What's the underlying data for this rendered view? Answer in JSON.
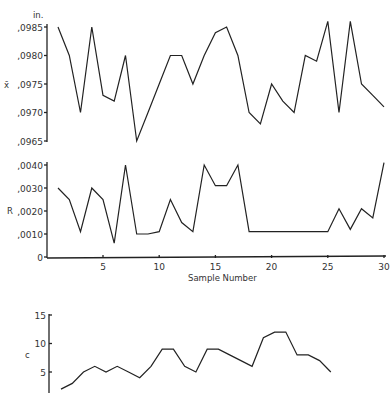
{
  "chart_data": [
    {
      "type": "line",
      "title": "X-bar chart",
      "ylabel": "x̄",
      "unit_label": "in.",
      "xlabel": "",
      "x": [
        1,
        2,
        3,
        4,
        5,
        6,
        7,
        8,
        9,
        10,
        11,
        12,
        13,
        14,
        15,
        16,
        17,
        18,
        19,
        20,
        21,
        22,
        23,
        24,
        25,
        26,
        27,
        28,
        29,
        30
      ],
      "values": [
        0.0985,
        0.098,
        0.097,
        0.0985,
        0.0973,
        0.0972,
        0.098,
        0.0965,
        0.097,
        0.0975,
        0.098,
        0.098,
        0.0975,
        0.098,
        0.0984,
        0.0985,
        0.098,
        0.097,
        0.0968,
        0.0975,
        0.0972,
        0.097,
        0.098,
        0.0979,
        0.0986,
        0.097,
        0.0986,
        0.0975,
        0.0973,
        0.0971
      ],
      "yticks": [
        ".0965",
        ".0970",
        ".0975",
        ".0980",
        ".0985"
      ],
      "ylim": [
        0.0965,
        0.0985
      ],
      "grid": false
    },
    {
      "type": "line",
      "title": "R chart",
      "ylabel": "R",
      "xlabel": "Sample Number",
      "x": [
        1,
        2,
        3,
        4,
        5,
        6,
        7,
        8,
        9,
        10,
        11,
        12,
        13,
        14,
        15,
        16,
        17,
        18,
        19,
        20,
        21,
        22,
        23,
        24,
        25,
        26,
        27,
        28,
        29,
        30
      ],
      "values": [
        0.003,
        0.0025,
        0.0011,
        0.003,
        0.0025,
        0.0006,
        0.004,
        0.001,
        0.001,
        0.0011,
        0.0025,
        0.0015,
        0.0011,
        0.004,
        0.0031,
        0.0031,
        0.004,
        0.0011,
        0.0011,
        0.0011,
        0.0011,
        0.0011,
        0.0011,
        0.0011,
        0.0011,
        0.0021,
        0.0012,
        0.0021,
        0.0017,
        0.0041
      ],
      "yticks": [
        "0",
        ".0010",
        ".0020",
        ".0030",
        ".0040"
      ],
      "xticks": [
        "5",
        "10",
        "15",
        "20",
        "25",
        "30"
      ],
      "ylim": [
        0,
        0.004
      ],
      "xlim": [
        0,
        30
      ],
      "grid": false
    },
    {
      "type": "line",
      "title": "c chart",
      "ylabel": "c",
      "xlabel": "",
      "x": [
        1,
        2,
        3,
        4,
        5,
        6,
        7,
        8,
        9,
        10,
        11,
        12,
        13,
        14,
        15,
        16,
        17,
        18,
        19,
        20,
        21,
        22,
        23,
        24,
        25
      ],
      "values": [
        2,
        3,
        5,
        6,
        5,
        6,
        5,
        4,
        6,
        9,
        9,
        6,
        5,
        9,
        9,
        8,
        7,
        6,
        11,
        12,
        12,
        8,
        8,
        7,
        5
      ],
      "yticks": [
        "5",
        "10",
        "15"
      ],
      "ylim": [
        0,
        15
      ],
      "grid": false
    }
  ],
  "labels": {
    "xbar_unit": "in.",
    "xbar_ylabel": "x̄",
    "r_ylabel": "R",
    "c_ylabel": "c",
    "xlabel": "Sample Number"
  },
  "colors": {
    "line": "#222222",
    "background": "#ffffff"
  }
}
